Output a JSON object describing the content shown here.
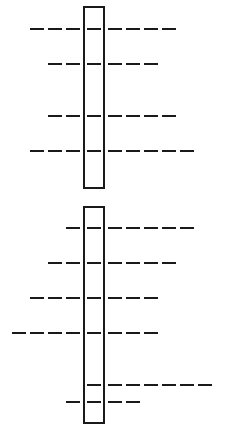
{
  "diagram": {
    "type": "dashed-band-ladder",
    "stroke_color": "#1a1a1a",
    "background": "#ffffff",
    "dash": {
      "length": 14,
      "pitch": 18,
      "thickness": 2
    },
    "column": {
      "left_dash_end_x": 80,
      "inside_dash_x": 87,
      "right_dash_start_x": 108
    },
    "blocks": [
      {
        "name": "upper",
        "rect": {
          "x": 83,
          "y": 6,
          "width": 22,
          "height": 183
        },
        "rows": [
          {
            "y": 29,
            "left": 3,
            "inside": 1,
            "right": 4
          },
          {
            "y": 64,
            "left": 2,
            "inside": 1,
            "right": 3
          },
          {
            "y": 116,
            "left": 2,
            "inside": 1,
            "right": 4
          },
          {
            "y": 151,
            "left": 3,
            "inside": 1,
            "right": 5
          }
        ]
      },
      {
        "name": "lower",
        "rect": {
          "x": 83,
          "y": 206,
          "width": 22,
          "height": 218
        },
        "rows": [
          {
            "y": 228,
            "left": 1,
            "inside": 1,
            "right": 5
          },
          {
            "y": 263,
            "left": 2,
            "inside": 1,
            "right": 4
          },
          {
            "y": 298,
            "left": 3,
            "inside": 1,
            "right": 3
          },
          {
            "y": 333,
            "left": 4,
            "inside": 1,
            "right": 3
          },
          {
            "y": 385,
            "left": 0,
            "inside": 1,
            "right": 6
          },
          {
            "y": 402,
            "left": 1,
            "inside": 1,
            "right": 2
          }
        ]
      }
    ]
  }
}
